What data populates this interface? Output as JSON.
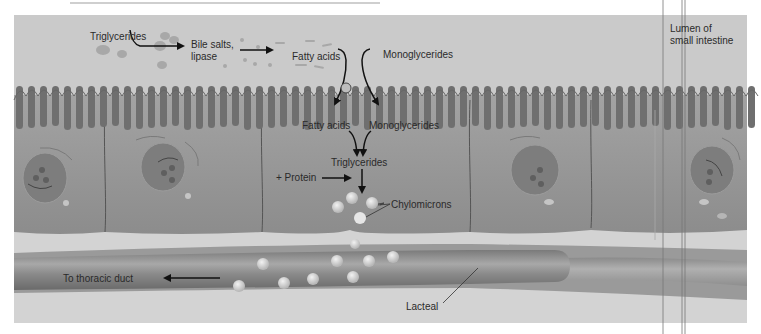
{
  "figure": {
    "labels": {
      "triglycerides_lumen": "Triglycerides",
      "bile_salts_line1": "Bile salts,",
      "bile_salts_line2": "lipase",
      "fatty_acids_lumen": "Fatty acids",
      "monoglycerides_lumen": "Monoglycerides",
      "fatty_acids_cell": "Fatty acids",
      "monoglycerides_cell": "Monoglycerides",
      "triglycerides_cell": "Triglycerides",
      "protein": "+ Protein",
      "chylomicrons": "Chylomicrons",
      "thoracic_duct": "To thoracic duct",
      "lacteal": "Lacteal",
      "lumen_line1": "Lumen of",
      "lumen_line2": "small intestine"
    },
    "colors": {
      "lumen_bg": "#c9c9c9",
      "cell_fill": "#8f8f8f",
      "microvilli": "#6e6e6e",
      "nucleus": "#7b7b7b",
      "lacteal": "#888888",
      "chylomicron": "#dcdcdc",
      "arrow": "#111111"
    }
  }
}
